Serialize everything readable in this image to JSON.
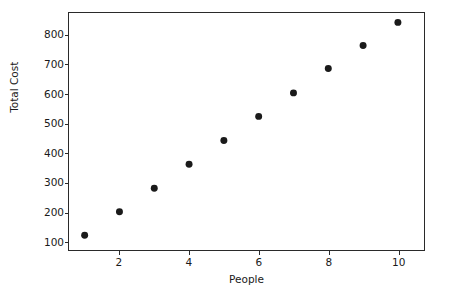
{
  "chart_data": {
    "type": "scatter",
    "title": "",
    "xlabel": "People",
    "ylabel": "Total Cost",
    "x": [
      1,
      2,
      3,
      4,
      5,
      6,
      7,
      8,
      9,
      10
    ],
    "values": [
      120,
      200,
      280,
      362,
      443,
      525,
      605,
      688,
      766,
      845
    ],
    "points": [
      {
        "x": 1,
        "y": 120
      },
      {
        "x": 2,
        "y": 200
      },
      {
        "x": 3,
        "y": 280
      },
      {
        "x": 4,
        "y": 362
      },
      {
        "x": 5,
        "y": 443
      },
      {
        "x": 6,
        "y": 525
      },
      {
        "x": 7,
        "y": 605
      },
      {
        "x": 8,
        "y": 688
      },
      {
        "x": 9,
        "y": 766
      },
      {
        "x": 10,
        "y": 845
      }
    ],
    "xlim": [
      0.55,
      10.75
    ],
    "ylim": [
      70,
      877
    ],
    "xticks": [
      2,
      4,
      6,
      8,
      10
    ],
    "xtick_labels": [
      "2",
      "4",
      "6",
      "8",
      "10"
    ],
    "yticks": [
      100,
      200,
      300,
      400,
      500,
      600,
      700,
      800
    ],
    "ytick_labels": [
      "100",
      "200",
      "300",
      "400",
      "500",
      "600",
      "700",
      "800"
    ],
    "grid": false,
    "legend": null,
    "legend_position": "none",
    "marker_color": "#1a1a1a",
    "marker_size": 7,
    "background_color": "#ffffff",
    "axis_color": "#2a2a2a"
  }
}
